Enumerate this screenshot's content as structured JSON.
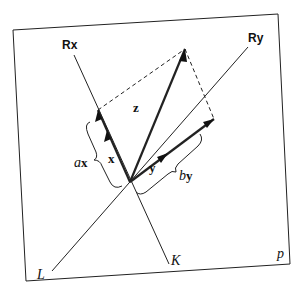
{
  "diagram": {
    "plane_label": "p",
    "axes": [
      {
        "id": "rx",
        "label": "Rx",
        "end_label": "K"
      },
      {
        "id": "ry",
        "label": "Ry",
        "end_label": "L"
      }
    ],
    "vectors": [
      {
        "id": "x",
        "label": "x"
      },
      {
        "id": "y",
        "label": "y"
      },
      {
        "id": "z",
        "label": "z"
      }
    ],
    "braces": [
      {
        "id": "ax",
        "coef": "a",
        "vec": "x"
      },
      {
        "id": "by",
        "coef": "b",
        "vec": "y"
      }
    ]
  }
}
